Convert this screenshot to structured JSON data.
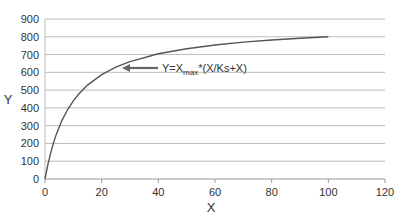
{
  "chart_data": {
    "type": "line",
    "title": "",
    "xlabel": "X",
    "ylabel": "Y",
    "xlim": [
      0,
      120
    ],
    "ylim": [
      0,
      900
    ],
    "x_ticks": [
      0,
      20,
      40,
      60,
      80,
      100,
      120
    ],
    "y_ticks": [
      0,
      100,
      200,
      300,
      400,
      500,
      600,
      700,
      800,
      900
    ],
    "grid": "horizontal",
    "series": [
      {
        "name": "Y=Xmax*(X/Ks+X)",
        "x": [
          0,
          1,
          2,
          3,
          4,
          5,
          6,
          8,
          10,
          12,
          15,
          20,
          25,
          30,
          40,
          50,
          60,
          70,
          80,
          90,
          100
        ],
        "y": [
          0,
          80,
          147,
          203,
          251,
          293,
          330,
          391,
          440,
          480,
          528,
          587,
          629,
          660,
          704,
          733,
          754,
          770,
          782,
          792,
          800
        ],
        "color": "#555555"
      }
    ],
    "annotation": {
      "text_prefix": "Y=X",
      "text_sub": "max",
      "text_suffix": "*(X/Ks+X)",
      "points_to": [
        28,
        630
      ]
    }
  }
}
